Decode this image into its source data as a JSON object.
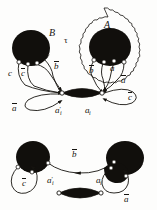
{
  "figure": {
    "caption_present": false,
    "panels": [
      {
        "id": "top-panel",
        "name": "upper-diagram",
        "region_labels": [
          {
            "name": "region-label-B",
            "text": "B",
            "x": 49,
            "y": 28,
            "size": "lg"
          },
          {
            "name": "region-label-A",
            "text": "A",
            "x": 104,
            "y": 20,
            "size": "lg"
          },
          {
            "name": "region-label-tau",
            "text": "τ",
            "x": 64,
            "y": 36,
            "size": "md"
          }
        ],
        "edge_labels": [
          {
            "name": "edge-label-c",
            "text": "c",
            "bar": false,
            "x": 8,
            "y": 69,
            "size": "md"
          },
          {
            "name": "edge-label-c-bar-left",
            "text": "c",
            "bar": true,
            "x": 21,
            "y": 69,
            "size": "md"
          },
          {
            "name": "edge-label-b-bar",
            "text": "b",
            "bar": true,
            "x": 54,
            "y": 62,
            "size": "md"
          },
          {
            "name": "edge-label-a-bar-left",
            "text": "a",
            "bar": true,
            "x": 12,
            "y": 104,
            "size": "md"
          },
          {
            "name": "node-label-a-i-prime",
            "text": "a",
            "bar": false,
            "prime": true,
            "sub": "i",
            "x": 55,
            "y": 106,
            "size": "md"
          },
          {
            "name": "node-label-a-i",
            "text": "a",
            "bar": false,
            "prime": false,
            "sub": "i",
            "x": 85,
            "y": 106,
            "size": "md"
          },
          {
            "name": "edge-label-b-bar-right",
            "text": "b",
            "bar": true,
            "x": 89,
            "y": 66,
            "size": "md"
          },
          {
            "name": "edge-label-a-bar-mid",
            "text": "a",
            "bar": true,
            "x": 110,
            "y": 64,
            "size": "md"
          },
          {
            "name": "edge-label-a-bar-right",
            "text": "a",
            "bar": true,
            "x": 121,
            "y": 76,
            "size": "md"
          },
          {
            "name": "edge-label-c-bar-right",
            "text": "c",
            "bar": true,
            "x": 128,
            "y": 93,
            "size": "md"
          }
        ]
      },
      {
        "id": "bottom-panel",
        "name": "lower-diagram",
        "region_labels": [],
        "edge_labels": [
          {
            "name": "edge-label-b-bar-bottom",
            "text": "b",
            "bar": true,
            "x": 72,
            "y": 150,
            "size": "md"
          },
          {
            "name": "edge-label-c-bar-bottom",
            "text": "c",
            "bar": true,
            "x": 22,
            "y": 179,
            "size": "md"
          },
          {
            "name": "edge-label-a-bar-bottom",
            "text": "a",
            "bar": true,
            "x": 124,
            "y": 195,
            "size": "md"
          },
          {
            "name": "node-label-a-i-prime-bottom",
            "text": "a",
            "bar": false,
            "prime": true,
            "sub": "i",
            "x": 47,
            "y": 176,
            "size": "md"
          },
          {
            "name": "node-label-a-i-bottom",
            "text": "a",
            "bar": false,
            "prime": false,
            "sub": "i",
            "x": 96,
            "y": 176,
            "size": "md"
          }
        ]
      }
    ],
    "colors": {
      "ink": "#15130f",
      "fill_blob": "#110f0c",
      "page": "#fdfdfc",
      "node_fill": "#ffffff"
    },
    "shapes": {
      "blob_top_left": {
        "name": "handlebody-blob-B",
        "cx": 31,
        "cy": 48,
        "rx": 19,
        "ry": 18
      },
      "blob_top_right": {
        "name": "handlebody-blob-A",
        "cx": 110,
        "cy": 47,
        "rx": 21,
        "ry": 19
      },
      "lens_top": {
        "name": "lens-band-top",
        "x1": 62,
        "y1": 93,
        "x2": 102,
        "y2": 93
      },
      "blob_bottom_left": {
        "name": "handlebody-blob-bottom-left",
        "cx": 33,
        "cy": 157,
        "rx": 17,
        "ry": 16
      },
      "blob_bottom_right": {
        "name": "handlebody-blob-bottom-right",
        "cx": 125,
        "cy": 158,
        "rx": 19,
        "ry": 17
      },
      "lens_bottom": {
        "name": "lens-band-bottom",
        "x1": 59,
        "y1": 193,
        "x2": 101,
        "y2": 193
      },
      "wavy_boundary": {
        "name": "wavy-region-boundary-A",
        "cx": 105,
        "cy": 60
      }
    }
  }
}
